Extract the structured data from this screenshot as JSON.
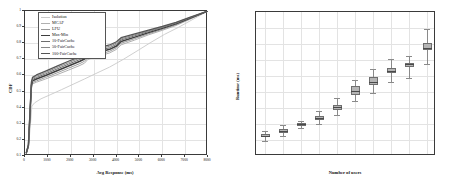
{
  "figure": {
    "panel_count": 2,
    "background": "#ffffff"
  },
  "chart_data": [
    {
      "type": "line",
      "title": "",
      "xlabel": "Avg Response (ms)",
      "ylabel": "CDF",
      "xlim": [
        0,
        8000
      ],
      "ylim": [
        0.1,
        1.0
      ],
      "xticks": [
        0,
        1000,
        2000,
        3000,
        4000,
        5000,
        6000,
        7000,
        8000
      ],
      "yticks": [
        0.1,
        0.2,
        0.3,
        0.4,
        0.5,
        0.6,
        0.7,
        0.8,
        0.9,
        1
      ],
      "xticklabels": [
        "0",
        "1000",
        "2000",
        "3000",
        "4000",
        "5000",
        "6000",
        "7000",
        "8000"
      ],
      "yticklabels": [
        "0.1",
        "0.2",
        "0.3",
        "0.4",
        "0.5",
        "0.6",
        "0.7",
        "0.8",
        "0.9",
        "1"
      ],
      "grid": true,
      "legend_position": "upper left",
      "series": [
        {
          "name": "Isolation",
          "color": "#c9c9c9",
          "width": 0.9,
          "points": [
            [
              60,
              0.12
            ],
            [
              150,
              0.15
            ],
            [
              240,
              0.3
            ],
            [
              300,
              0.41
            ],
            [
              420,
              0.43
            ],
            [
              700,
              0.455
            ],
            [
              1100,
              0.48
            ],
            [
              1600,
              0.512
            ],
            [
              2100,
              0.545
            ],
            [
              2600,
              0.578
            ],
            [
              3100,
              0.612
            ],
            [
              3700,
              0.652
            ],
            [
              4300,
              0.7
            ],
            [
              4900,
              0.752
            ],
            [
              5500,
              0.805
            ],
            [
              6100,
              0.855
            ],
            [
              6700,
              0.898
            ],
            [
              7300,
              0.945
            ],
            [
              8000,
              1.0
            ]
          ]
        },
        {
          "name": "MCAF",
          "color": "#b0b0b0",
          "width": 1.0,
          "points": [
            [
              60,
              0.12
            ],
            [
              150,
              0.16
            ],
            [
              230,
              0.38
            ],
            [
              280,
              0.52
            ],
            [
              330,
              0.548
            ],
            [
              500,
              0.558
            ],
            [
              900,
              0.578
            ],
            [
              1400,
              0.605
            ],
            [
              1900,
              0.633
            ],
            [
              2400,
              0.662
            ],
            [
              2600,
              0.676
            ],
            [
              2750,
              0.7
            ],
            [
              3200,
              0.718
            ],
            [
              3700,
              0.74
            ],
            [
              4000,
              0.762
            ],
            [
              4200,
              0.79
            ],
            [
              4800,
              0.82
            ],
            [
              5400,
              0.852
            ],
            [
              6000,
              0.88
            ],
            [
              6600,
              0.91
            ],
            [
              7200,
              0.948
            ],
            [
              8000,
              1.0
            ]
          ]
        },
        {
          "name": "LFU",
          "color": "#9a9a9a",
          "width": 1.0,
          "points": [
            [
              60,
              0.12
            ],
            [
              150,
              0.162
            ],
            [
              230,
              0.385
            ],
            [
              280,
              0.528
            ],
            [
              330,
              0.556
            ],
            [
              500,
              0.566
            ],
            [
              900,
              0.588
            ],
            [
              1400,
              0.616
            ],
            [
              1900,
              0.645
            ],
            [
              2400,
              0.674
            ],
            [
              2600,
              0.688
            ],
            [
              2750,
              0.712
            ],
            [
              3200,
              0.729
            ],
            [
              3700,
              0.75
            ],
            [
              4000,
              0.772
            ],
            [
              4200,
              0.8
            ],
            [
              4800,
              0.829
            ],
            [
              5400,
              0.859
            ],
            [
              6000,
              0.886
            ],
            [
              6600,
              0.915
            ],
            [
              7200,
              0.951
            ],
            [
              8000,
              1.0
            ]
          ]
        },
        {
          "name": "Max-Min",
          "color": "#3d3d3d",
          "width": 1.5,
          "points": [
            [
              60,
              0.12
            ],
            [
              150,
              0.165
            ],
            [
              230,
              0.392
            ],
            [
              280,
              0.538
            ],
            [
              330,
              0.566
            ],
            [
              500,
              0.578
            ],
            [
              900,
              0.6
            ],
            [
              1400,
              0.629
            ],
            [
              1900,
              0.659
            ],
            [
              2400,
              0.688
            ],
            [
              2600,
              0.702
            ],
            [
              2750,
              0.726
            ],
            [
              3200,
              0.742
            ],
            [
              3700,
              0.762
            ],
            [
              4000,
              0.783
            ],
            [
              4200,
              0.811
            ],
            [
              4800,
              0.838
            ],
            [
              5400,
              0.866
            ],
            [
              6000,
              0.892
            ],
            [
              6600,
              0.92
            ],
            [
              7200,
              0.954
            ],
            [
              8000,
              1.0
            ]
          ]
        },
        {
          "name": "10-FairCache",
          "color": "#6e6e6e",
          "width": 1.0,
          "points": [
            [
              60,
              0.12
            ],
            [
              150,
              0.167
            ],
            [
              230,
              0.398
            ],
            [
              280,
              0.546
            ],
            [
              330,
              0.574
            ],
            [
              500,
              0.587
            ],
            [
              900,
              0.61
            ],
            [
              1400,
              0.64
            ],
            [
              1900,
              0.67
            ],
            [
              2400,
              0.699
            ],
            [
              2600,
              0.713
            ],
            [
              2750,
              0.737
            ],
            [
              3200,
              0.753
            ],
            [
              3700,
              0.772
            ],
            [
              4000,
              0.793
            ],
            [
              4200,
              0.82
            ],
            [
              4800,
              0.846
            ],
            [
              5400,
              0.872
            ],
            [
              6000,
              0.897
            ],
            [
              6600,
              0.924
            ],
            [
              7200,
              0.957
            ],
            [
              8000,
              1.0
            ]
          ]
        },
        {
          "name": "50-FairCache",
          "color": "#888888",
          "width": 1.0,
          "points": [
            [
              60,
              0.12
            ],
            [
              150,
              0.169
            ],
            [
              230,
              0.403
            ],
            [
              280,
              0.553
            ],
            [
              330,
              0.581
            ],
            [
              500,
              0.595
            ],
            [
              900,
              0.618
            ],
            [
              1400,
              0.649
            ],
            [
              1900,
              0.679
            ],
            [
              2400,
              0.708
            ],
            [
              2600,
              0.722
            ],
            [
              2750,
              0.746
            ],
            [
              3200,
              0.762
            ],
            [
              3700,
              0.781
            ],
            [
              4000,
              0.801
            ],
            [
              4200,
              0.827
            ],
            [
              4800,
              0.852
            ],
            [
              5400,
              0.877
            ],
            [
              6000,
              0.901
            ],
            [
              6600,
              0.927
            ],
            [
              7200,
              0.959
            ],
            [
              8000,
              1.0
            ]
          ]
        },
        {
          "name": "100-FairCache",
          "color": "#555555",
          "width": 1.3,
          "points": [
            [
              60,
              0.12
            ],
            [
              150,
              0.171
            ],
            [
              230,
              0.408
            ],
            [
              280,
              0.56
            ],
            [
              330,
              0.588
            ],
            [
              500,
              0.603
            ],
            [
              900,
              0.627
            ],
            [
              1400,
              0.658
            ],
            [
              1900,
              0.688
            ],
            [
              2400,
              0.717
            ],
            [
              2600,
              0.731
            ],
            [
              2750,
              0.755
            ],
            [
              3200,
              0.771
            ],
            [
              3700,
              0.789
            ],
            [
              4000,
              0.809
            ],
            [
              4200,
              0.834
            ],
            [
              4800,
              0.858
            ],
            [
              5400,
              0.882
            ],
            [
              6000,
              0.905
            ],
            [
              6600,
              0.93
            ],
            [
              7200,
              0.961
            ],
            [
              8000,
              1.0
            ]
          ]
        }
      ]
    },
    {
      "type": "box",
      "title": "",
      "xlabel": "Number of users",
      "ylabel": "Runtime (ms)",
      "ylim": [
        0,
        450
      ],
      "yticks": [
        0,
        50,
        100,
        150,
        200,
        250,
        300,
        350,
        400,
        450
      ],
      "yticklabels": [
        "0",
        "50",
        "100",
        "150",
        "200",
        "250",
        "300",
        "350",
        "400",
        "450"
      ],
      "categories": [
        "10",
        "20",
        "30",
        "40",
        "50",
        "60",
        "70",
        "80",
        "90",
        "100"
      ],
      "grid": true,
      "boxes": [
        {
          "category": "10",
          "whisker_low": 48,
          "q1": 58,
          "median": 63,
          "q3": 70,
          "whisker_high": 78
        },
        {
          "category": "20",
          "whisker_low": 62,
          "q1": 73,
          "median": 78,
          "q3": 84,
          "whisker_high": 96
        },
        {
          "category": "30",
          "whisker_low": 88,
          "q1": 95,
          "median": 99,
          "q3": 103,
          "whisker_high": 110
        },
        {
          "category": "40",
          "whisker_low": 100,
          "q1": 112,
          "median": 118,
          "q3": 126,
          "whisker_high": 140
        },
        {
          "category": "50",
          "whisker_low": 128,
          "q1": 145,
          "median": 152,
          "q3": 160,
          "whisker_high": 182
        },
        {
          "category": "60",
          "whisker_low": 172,
          "q1": 192,
          "median": 203,
          "q3": 218,
          "whisker_high": 236
        },
        {
          "category": "70",
          "whisker_low": 198,
          "q1": 222,
          "median": 232,
          "q3": 246,
          "whisker_high": 272
        },
        {
          "category": "80",
          "whisker_low": 232,
          "q1": 258,
          "median": 266,
          "q3": 274,
          "whisker_high": 302
        },
        {
          "category": "90",
          "whisker_low": 245,
          "q1": 278,
          "median": 286,
          "q3": 292,
          "whisker_high": 312
        },
        {
          "category": "100",
          "whisker_low": 288,
          "q1": 330,
          "median": 338,
          "q3": 352,
          "whisker_high": 398
        }
      ],
      "style": {
        "box_fill": "#b5b5b5",
        "box_edge": "#6e6e6e",
        "median_color": "#4a4a4a",
        "whisker_color": "#8a8a8a"
      }
    }
  ]
}
